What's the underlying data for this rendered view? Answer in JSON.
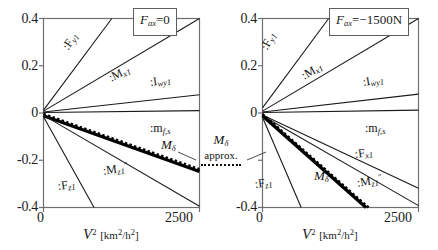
{
  "figure": {
    "background": "#ffffff",
    "axis_color": "#6f6f6f",
    "curve_color": "#1a1a1a",
    "emphasis_color": "#000000"
  },
  "axes": {
    "x_title_symbol": "V",
    "x_title_exponent": "2",
    "x_unit": "[km",
    "x_unit_sup": "2",
    "x_unit_mid": "/h",
    "x_unit_sup2": "2",
    "x_unit_end": "]",
    "x_ticks": [
      "0",
      "2500"
    ],
    "x_min": 0,
    "x_max": 2500,
    "y_ticks": [
      "0.4",
      "0.2",
      "0",
      "-0.2",
      "-0.4"
    ],
    "y_min": -0.4,
    "y_max": 0.4
  },
  "annotation": {
    "symbol": "M",
    "symbol_sub": "δ",
    "text": "approx.",
    "line_style": "dotted"
  },
  "panels": [
    {
      "id": "left",
      "title_symbol": "F",
      "title_sub": "ax",
      "title_value": "=0",
      "title_full": "Fax=0"
    },
    {
      "id": "right",
      "title_symbol": "F",
      "title_sub": "ax",
      "title_value": "=−1500N",
      "title_full": "Fax=-1500N"
    }
  ],
  "chart_data": {
    "type": "line",
    "xlabel": "V^2 [km^2/h^2]",
    "ylabel": "",
    "xlim": [
      0,
      2500
    ],
    "ylim": [
      -0.4,
      0.4
    ],
    "grid": false,
    "legend": "inline curve labels",
    "panels": [
      {
        "name": "Fax=0",
        "title": "Fax = 0",
        "series": [
          {
            "name": ":F_y1",
            "label": ":F",
            "label_sub": "y1",
            "x": [
              0,
              1095
            ],
            "values": [
              0.012,
              0.4
            ],
            "style": "solid",
            "width": 1.1,
            "label_x": 66,
            "label_y": 42,
            "rotate": -56
          },
          {
            "name": ":M_x1",
            "label": ":M",
            "label_sub": "x1",
            "x": [
              0,
              2500
            ],
            "values": [
              0.008,
              0.4
            ],
            "style": "solid",
            "width": 1.1,
            "label_x": 112,
            "label_y": 73,
            "rotate": -25
          },
          {
            "name": ":I_wy1",
            "label": ":I",
            "label_sub": "wy1",
            "x": [
              0,
              2500
            ],
            "values": [
              0.004,
              0.077
            ],
            "style": "solid",
            "width": 1.1,
            "label_x": 150,
            "label_y": 78,
            "rotate": -8
          },
          {
            "name": ":m_f,s",
            "label": ":m",
            "label_sub": "f,s",
            "x": [
              0,
              2500
            ],
            "values": [
              0.002,
              0.01
            ],
            "style": "solid",
            "width": 1.1,
            "label_x": 152,
            "label_y": 123,
            "rotate": 0
          },
          {
            "name": "M_delta",
            "label": "M",
            "label_sub": "δ",
            "x": [
              0,
              2500
            ],
            "values": [
              -0.012,
              -0.248
            ],
            "style": "thick",
            "width": 3.2,
            "label_x": 164,
            "label_y": 142,
            "rotate": 0
          },
          {
            "name": "M_delta_approx",
            "label": "",
            "label_sub": "",
            "x": [
              0,
              2500
            ],
            "values": [
              -0.004,
              -0.238
            ],
            "style": "dotted",
            "width": 2.4,
            "label_x": 0,
            "label_y": 0,
            "rotate": 0
          },
          {
            "name": ":M''_z1",
            "label": ":M",
            "label_sub": "z1",
            "label_sup": "″",
            "x": [
              0,
              2500
            ],
            "values": [
              -0.01,
              -0.395
            ],
            "style": "solid",
            "width": 1.1,
            "label_x": 108,
            "label_y": 166,
            "rotate": 0
          },
          {
            "name": ":F_z1",
            "label": ":F",
            "label_sub": "z1",
            "x": [
              0,
              810
            ],
            "values": [
              -0.016,
              -0.4
            ],
            "style": "solid",
            "width": 1.1,
            "label_x": 62,
            "label_y": 180,
            "rotate": 0
          }
        ]
      },
      {
        "name": "Fax=-1500N",
        "title": "Fax = -1500 N",
        "series": [
          {
            "name": ":F_y1",
            "label": ":F",
            "label_sub": "y1",
            "x": [
              0,
              1060
            ],
            "values": [
              0.022,
              0.4
            ],
            "style": "solid",
            "width": 1.1,
            "label_x": 46,
            "label_y": 42,
            "rotate": -60
          },
          {
            "name": ":M_x1",
            "label": ":M",
            "label_sub": "x1",
            "x": [
              0,
              2500
            ],
            "values": [
              0.008,
              0.4
            ],
            "style": "solid",
            "width": 1.1,
            "label_x": 86,
            "label_y": 70,
            "rotate": -28
          },
          {
            "name": ":I_wy1",
            "label": ":I",
            "label_sub": "wy1",
            "x": [
              0,
              2500
            ],
            "values": [
              0.004,
              0.08
            ],
            "style": "solid",
            "width": 1.1,
            "label_x": 146,
            "label_y": 78,
            "rotate": -9
          },
          {
            "name": ":m_f,s",
            "label": ":m",
            "label_sub": "f,s",
            "x": [
              0,
              2500
            ],
            "values": [
              0.002,
              0.012
            ],
            "style": "solid",
            "width": 1.1,
            "label_x": 148,
            "label_y": 123,
            "rotate": 0
          },
          {
            "name": ":F_x1",
            "label": ":F",
            "label_sub": "x1",
            "x": [
              0,
              2500
            ],
            "values": [
              -0.008,
              -0.318
            ],
            "style": "solid",
            "width": 1.1,
            "label_x": 140,
            "label_y": 150,
            "rotate": 0
          },
          {
            "name": ":M''_z1",
            "label": ":M",
            "label_sub": "z1",
            "label_sup": "″",
            "x": [
              0,
              2500
            ],
            "values": [
              -0.012,
              -0.392
            ],
            "style": "solid",
            "width": 1.1,
            "label_x": 142,
            "label_y": 176,
            "rotate": 0
          },
          {
            "name": "M_delta",
            "label": "M",
            "label_sub": "δ",
            "x": [
              0,
              1660
            ],
            "values": [
              -0.012,
              -0.4
            ],
            "style": "thick",
            "width": 3.4,
            "label_x": 98,
            "label_y": 172,
            "rotate": 0
          },
          {
            "name": "M_delta_approx",
            "label": "",
            "label_sub": "",
            "x": [
              0,
              1700
            ],
            "values": [
              -0.004,
              -0.4
            ],
            "style": "dotted",
            "width": 2.4,
            "label_x": 0,
            "label_y": 0,
            "rotate": 0
          },
          {
            "name": ":F_z1",
            "label": ":F",
            "label_sub": "z1",
            "x": [
              0,
              620
            ],
            "values": [
              -0.018,
              -0.4
            ],
            "style": "solid",
            "width": 1.1,
            "label_x": 38,
            "label_y": 178,
            "rotate": 0
          }
        ]
      }
    ]
  }
}
